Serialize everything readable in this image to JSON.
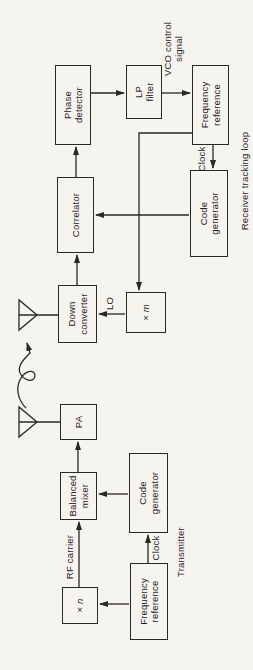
{
  "colors": {
    "paper": "#f6f4ef",
    "ink": "#2a2825"
  },
  "diagram": {
    "transmitter": {
      "section_label": "Transmitter",
      "boxes": {
        "freq_ref": {
          "line1": "Frequency",
          "line2": "reference"
        },
        "multiplier": {
          "symbol": "×",
          "var": "n"
        },
        "code_gen": {
          "line1": "Code",
          "line2": "generator"
        },
        "balanced_mixer": {
          "line1": "Balanced",
          "line2": "mixer"
        },
        "pa": {
          "line1": "PA"
        }
      },
      "signal_labels": {
        "rf_carrier": "RF carrier",
        "clock": "Clock"
      }
    },
    "receiver": {
      "section_label": "Receiver tracking loop",
      "boxes": {
        "down_converter": {
          "line1": "Down",
          "line2": "converter"
        },
        "multiplier": {
          "symbol": "×",
          "var": "m"
        },
        "correlator": {
          "line1": "Correlator"
        },
        "code_gen": {
          "line1": "Code",
          "line2": "generator"
        },
        "phase_detector": {
          "line1": "Phase",
          "line2": "detector"
        },
        "lp_filter": {
          "line1": "LP",
          "line2": "filter"
        },
        "freq_ref": {
          "line1": "Frequency",
          "line2": "reference"
        }
      },
      "signal_labels": {
        "lo": "LO",
        "clock": "Clock",
        "vco_line1": "VCO control",
        "vco_line2": "signal"
      }
    }
  }
}
